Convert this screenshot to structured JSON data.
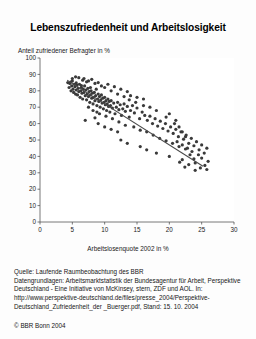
{
  "title": "Lebenszufriedenheit und Arbeitslosigkeit",
  "source": {
    "line1": "Quelle: Laufende Raumbeobachtung des BBR",
    "line2": "Datengrundlagen: Arbeitsmarktstatistik der Bundesagentur für Arbeit, Perspektive Deutschland - Eine Initiative von McKinsey, stern, ZDF und AOL. In: http://www.perspektive-deutschland.de/files/presse_2004/Perspektive-Deutschland_Zufriedenheit_der _Buerger.pdf, Stand: 15. 10. 2004",
    "copyright": "© BBR Bonn 2004"
  },
  "chart_data": {
    "type": "scatter",
    "title": "Lebenszufriedenheit und Arbeitslosigkeit",
    "xlabel": "Arbeitslosenquote 2002 in %",
    "ylabel": "Anteil zufriedener Befragter in %",
    "xlim": [
      0,
      30
    ],
    "ylim": [
      0,
      100
    ],
    "xticks": [
      0,
      5,
      10,
      15,
      20,
      25,
      30
    ],
    "yticks": [
      0,
      10,
      20,
      30,
      40,
      50,
      60,
      70,
      80,
      90,
      100
    ],
    "grid": false,
    "legend": null,
    "marker_color": "#3a3a3a",
    "marker_size": 1.6,
    "trendline": {
      "type": "linear-fit",
      "color": "#4a4a4a",
      "x_start": 4.2,
      "y_start": 86.5,
      "x_end": 25.2,
      "y_end": 34.0
    },
    "points": [
      [
        4.3,
        85.0
      ],
      [
        4.5,
        82.0
      ],
      [
        4.6,
        84.5
      ],
      [
        4.8,
        80.0
      ],
      [
        4.9,
        83.0
      ],
      [
        5.0,
        86.0
      ],
      [
        5.1,
        81.0
      ],
      [
        5.2,
        79.0
      ],
      [
        5.3,
        84.0
      ],
      [
        5.4,
        82.5
      ],
      [
        5.5,
        78.0
      ],
      [
        5.6,
        80.5
      ],
      [
        5.7,
        83.5
      ],
      [
        5.8,
        77.5
      ],
      [
        5.9,
        81.5
      ],
      [
        6.0,
        79.5
      ],
      [
        6.1,
        84.0
      ],
      [
        6.2,
        76.0
      ],
      [
        6.3,
        80.0
      ],
      [
        6.4,
        82.0
      ],
      [
        6.5,
        78.5
      ],
      [
        6.6,
        75.0
      ],
      [
        6.7,
        81.0
      ],
      [
        6.8,
        79.0
      ],
      [
        6.9,
        83.0
      ],
      [
        7.0,
        77.0
      ],
      [
        7.1,
        80.5
      ],
      [
        7.2,
        74.5
      ],
      [
        7.3,
        78.0
      ],
      [
        7.4,
        81.5
      ],
      [
        7.5,
        76.5
      ],
      [
        7.6,
        79.5
      ],
      [
        7.7,
        73.0
      ],
      [
        7.8,
        77.5
      ],
      [
        7.9,
        80.0
      ],
      [
        8.0,
        75.5
      ],
      [
        8.1,
        78.5
      ],
      [
        8.2,
        72.0
      ],
      [
        8.3,
        76.0
      ],
      [
        8.4,
        79.0
      ],
      [
        8.5,
        74.0
      ],
      [
        8.6,
        77.0
      ],
      [
        8.7,
        81.0
      ],
      [
        8.8,
        71.0
      ],
      [
        8.9,
        75.0
      ],
      [
        9.0,
        78.0
      ],
      [
        9.1,
        73.5
      ],
      [
        9.2,
        76.5
      ],
      [
        9.3,
        70.0
      ],
      [
        9.4,
        74.5
      ],
      [
        9.5,
        77.5
      ],
      [
        9.6,
        72.5
      ],
      [
        9.7,
        75.5
      ],
      [
        9.8,
        69.0
      ],
      [
        9.9,
        73.0
      ],
      [
        10.0,
        76.0
      ],
      [
        10.1,
        71.5
      ],
      [
        10.2,
        74.0
      ],
      [
        10.3,
        68.0
      ],
      [
        10.4,
        72.0
      ],
      [
        10.5,
        75.0
      ],
      [
        10.6,
        70.5
      ],
      [
        10.7,
        73.5
      ],
      [
        10.8,
        67.0
      ],
      [
        10.9,
        71.0
      ],
      [
        11.0,
        74.0
      ],
      [
        11.2,
        69.5
      ],
      [
        11.4,
        72.5
      ],
      [
        11.6,
        66.0
      ],
      [
        11.8,
        70.0
      ],
      [
        12.0,
        73.0
      ],
      [
        12.2,
        68.5
      ],
      [
        12.4,
        71.5
      ],
      [
        12.6,
        65.0
      ],
      [
        12.8,
        69.0
      ],
      [
        13.0,
        72.0
      ],
      [
        13.2,
        67.5
      ],
      [
        13.5,
        70.5
      ],
      [
        13.8,
        64.0
      ],
      [
        14.0,
        68.0
      ],
      [
        14.3,
        71.0
      ],
      [
        14.6,
        66.5
      ],
      [
        15.0,
        69.5
      ],
      [
        15.4,
        63.0
      ],
      [
        15.8,
        67.0
      ],
      [
        16.2,
        65.0
      ],
      [
        16.6,
        62.0
      ],
      [
        17.0,
        64.5
      ],
      [
        17.4,
        60.0
      ],
      [
        17.8,
        63.0
      ],
      [
        18.2,
        58.5
      ],
      [
        18.6,
        61.5
      ],
      [
        19.0,
        57.0
      ],
      [
        19.4,
        60.0
      ],
      [
        19.8,
        55.5
      ],
      [
        20.2,
        58.0
      ],
      [
        20.6,
        54.0
      ],
      [
        21.0,
        56.5
      ],
      [
        21.4,
        52.0
      ],
      [
        21.8,
        55.0
      ],
      [
        22.2,
        50.5
      ],
      [
        22.6,
        53.0
      ],
      [
        23.0,
        48.0
      ],
      [
        23.4,
        51.0
      ],
      [
        23.8,
        46.5
      ],
      [
        24.2,
        49.0
      ],
      [
        24.6,
        44.0
      ],
      [
        25.0,
        47.0
      ],
      [
        25.4,
        42.0
      ],
      [
        25.8,
        45.0
      ],
      [
        6.0,
        88.0
      ],
      [
        6.6,
        86.5
      ],
      [
        7.2,
        85.5
      ],
      [
        8.0,
        87.0
      ],
      [
        9.0,
        85.0
      ],
      [
        10.5,
        84.0
      ],
      [
        11.5,
        82.5
      ],
      [
        12.5,
        81.0
      ],
      [
        13.5,
        79.5
      ],
      [
        9.5,
        83.0
      ],
      [
        8.5,
        84.5
      ],
      [
        7.5,
        86.0
      ],
      [
        11.0,
        80.0
      ],
      [
        12.0,
        78.0
      ],
      [
        14.0,
        77.0
      ],
      [
        15.0,
        76.0
      ],
      [
        16.0,
        75.0
      ],
      [
        13.0,
        76.5
      ],
      [
        10.0,
        82.0
      ],
      [
        6.8,
        87.5
      ],
      [
        5.5,
        88.5
      ],
      [
        8.2,
        68.0
      ],
      [
        9.2,
        66.0
      ],
      [
        10.2,
        64.5
      ],
      [
        11.2,
        63.0
      ],
      [
        12.2,
        61.0
      ],
      [
        13.2,
        59.0
      ],
      [
        7.5,
        70.0
      ],
      [
        8.8,
        67.0
      ],
      [
        14.5,
        58.0
      ],
      [
        15.5,
        56.0
      ],
      [
        16.5,
        55.0
      ],
      [
        17.5,
        53.0
      ],
      [
        18.5,
        51.0
      ],
      [
        19.5,
        49.5
      ],
      [
        20.5,
        48.0
      ],
      [
        21.5,
        46.0
      ],
      [
        22.5,
        44.5
      ],
      [
        23.5,
        43.0
      ],
      [
        24.5,
        41.0
      ],
      [
        21.0,
        62.0
      ],
      [
        21.5,
        58.0
      ],
      [
        22.0,
        55.0
      ],
      [
        22.5,
        52.0
      ],
      [
        20.8,
        60.0
      ],
      [
        21.2,
        49.0
      ],
      [
        22.0,
        47.0
      ],
      [
        22.8,
        45.0
      ],
      [
        23.2,
        41.0
      ],
      [
        23.8,
        38.5
      ],
      [
        24.0,
        36.0
      ],
      [
        25.0,
        39.0
      ],
      [
        26.0,
        37.0
      ],
      [
        24.8,
        33.0
      ],
      [
        25.5,
        34.5
      ],
      [
        19.5,
        64.0
      ],
      [
        20.0,
        66.0
      ],
      [
        18.0,
        68.0
      ],
      [
        17.0,
        70.0
      ],
      [
        16.0,
        71.0
      ],
      [
        14.8,
        73.0
      ],
      [
        13.8,
        74.5
      ],
      [
        9.0,
        60.0
      ],
      [
        10.0,
        58.0
      ],
      [
        7.0,
        62.0
      ],
      [
        11.0,
        56.5
      ],
      [
        12.0,
        55.0
      ],
      [
        15.5,
        46.0
      ],
      [
        16.5,
        44.0
      ],
      [
        18.0,
        42.0
      ],
      [
        20.0,
        40.0
      ],
      [
        22.0,
        38.0
      ],
      [
        12.5,
        50.0
      ],
      [
        13.5,
        48.0
      ],
      [
        8.5,
        63.5
      ],
      [
        5.0,
        87.5
      ],
      [
        4.8,
        85.5
      ],
      [
        5.6,
        84.8
      ],
      [
        6.4,
        83.2
      ],
      [
        7.8,
        82.0
      ],
      [
        23.0,
        35.0
      ],
      [
        24.0,
        31.5
      ],
      [
        22.4,
        33.5
      ],
      [
        25.8,
        32.0
      ],
      [
        21.6,
        36.5
      ]
    ]
  }
}
